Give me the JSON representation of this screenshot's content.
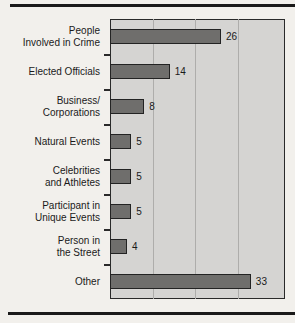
{
  "page": {
    "background_color": "#f2f0ec",
    "rule_color": "#1a1a1a"
  },
  "chart_style": {
    "plot_background": "#d5d4d2",
    "bar_color": "#6f6e6c",
    "bar_border_color": "#232323",
    "gridline_color": "#aeadab",
    "axis_color": "#2a2a2a",
    "text_color": "#1a1a1a"
  },
  "chart_data": {
    "type": "bar",
    "orientation": "horizontal",
    "title": "",
    "subtitle": "",
    "xlabel": "",
    "ylabel": "",
    "legend": [],
    "legend_position": "none",
    "grid": true,
    "grid_axis": "x",
    "xlim": [
      0,
      41
    ],
    "gridline_values": [
      10,
      20,
      30
    ],
    "data_labels": true,
    "categories": [
      "People\nInvolved in Crime",
      "Elected Officials",
      "Business/\nCorporations",
      "Natural Events",
      "Celebrities\nand Athletes",
      "Participant in\nUnique Events",
      "Person in\nthe Street",
      "Other"
    ],
    "values": [
      26,
      14,
      8,
      5,
      5,
      5,
      4,
      33
    ],
    "value_labels": [
      "26",
      "14",
      "8",
      "5",
      "5",
      "5",
      "4",
      "33"
    ]
  }
}
